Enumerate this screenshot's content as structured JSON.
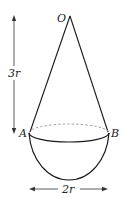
{
  "diagram": {
    "labels": {
      "apex": "O",
      "left_point": "A",
      "right_point": "B",
      "height": "3r",
      "width": "2r"
    },
    "shapes": [
      "cone",
      "hemisphere"
    ],
    "colors": {
      "stroke": "#1a1a1a",
      "dashed": "#888888",
      "background": "#ffffff"
    }
  }
}
